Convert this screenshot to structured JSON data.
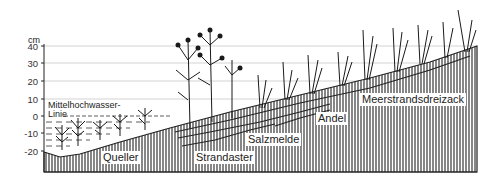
{
  "diagram": {
    "type": "salt marsh vegetation zonation profile",
    "y_axis": {
      "unit": "cm",
      "ticks": [
        "40",
        "30",
        "20",
        "10",
        "0",
        "-10",
        "-20"
      ]
    },
    "annotations": {
      "mean_high_water_line_1": "Mittelhochwasser-",
      "mean_high_water_line_2": "Linie"
    },
    "zones": [
      {
        "label": "Queller"
      },
      {
        "label": "Strandaster"
      },
      {
        "label": "Salzmelde"
      },
      {
        "label": "Andel"
      },
      {
        "label": "Meerstrandsdreizack"
      }
    ],
    "colors": {
      "ink": "#222222",
      "background": "#ffffff",
      "gridline": "#bbbbbb"
    }
  }
}
